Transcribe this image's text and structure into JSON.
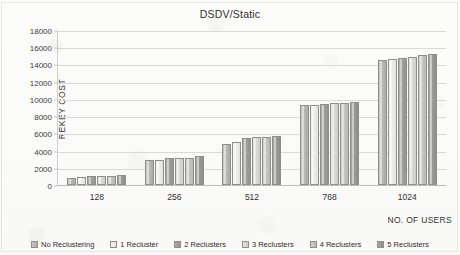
{
  "chart_data": {
    "type": "bar",
    "title": "DSDV/Static",
    "xlabel": "NO. OF USERS",
    "ylabel": "REKEY COST",
    "categories": [
      "128",
      "256",
      "512",
      "768",
      "1024"
    ],
    "ylim": [
      0,
      18000
    ],
    "yticks": [
      0,
      2000,
      4000,
      6000,
      8000,
      10000,
      12000,
      14000,
      16000,
      18000
    ],
    "grid": true,
    "legend_position": "bottom",
    "series": [
      {
        "name": "No Reclustering",
        "color": "#bbbbb8",
        "values": [
          850,
          2850,
          4800,
          9330,
          14500
        ]
      },
      {
        "name": "1 Recluster",
        "color": "#ebebe8",
        "values": [
          950,
          2870,
          5050,
          9320,
          14620
        ]
      },
      {
        "name": "2 Reclusters",
        "color": "#9e9e9b",
        "values": [
          1000,
          3080,
          5480,
          9400,
          14760
        ]
      },
      {
        "name": "3 Reclusters",
        "color": "#d8d8d5",
        "values": [
          1020,
          3120,
          5520,
          9550,
          14900
        ]
      },
      {
        "name": "4 Reclusters",
        "color": "#c4c4c1",
        "values": [
          1050,
          3180,
          5580,
          9560,
          15050
        ]
      },
      {
        "name": "5 Reclusters",
        "color": "#9a9a97",
        "values": [
          1150,
          3320,
          5700,
          9620,
          15160
        ]
      }
    ]
  }
}
